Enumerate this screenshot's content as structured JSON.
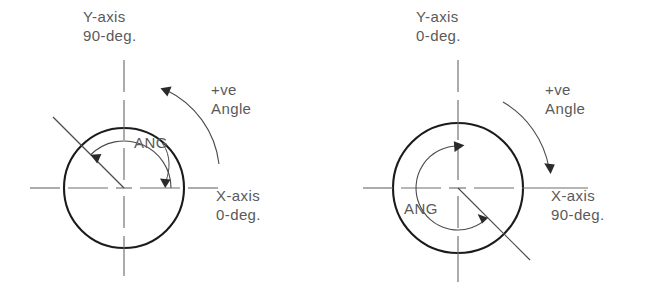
{
  "figure": {
    "background_color": "#ffffff",
    "text_color": "#5a5a5a",
    "circle_color": "#1b1b1b",
    "centerline_color": "#6e6e6e"
  },
  "diagrams": [
    {
      "id": "left",
      "name": "ccw-convention",
      "center": {
        "x": 124,
        "y": 188
      },
      "radius": 60,
      "y_axis_label_line1": "Y-axis",
      "y_axis_label_line2": "90-deg.",
      "x_axis_label_line1": "X-axis",
      "x_axis_label_line2": "0-deg.",
      "positive_label_line1": "+ve",
      "positive_label_line2": "Angle",
      "angle_label": "ANG",
      "angle_start_deg": 0,
      "angle_end_deg": 135,
      "rotation_direction": "counterclockwise",
      "radial_line_deg": 135
    },
    {
      "id": "right",
      "name": "cw-convention",
      "center": {
        "x": 458,
        "y": 188
      },
      "radius": 65,
      "y_axis_label_line1": "Y-axis",
      "y_axis_label_line2": "0-deg.",
      "x_axis_label_line1": "X-axis",
      "x_axis_label_line2": "90-deg.",
      "positive_label_line1": "+ve",
      "positive_label_line2": "Angle",
      "angle_label": "ANG",
      "angle_start_deg": 90,
      "angle_end_deg": 315,
      "rotation_direction": "clockwise",
      "radial_line_deg": 315
    }
  ]
}
